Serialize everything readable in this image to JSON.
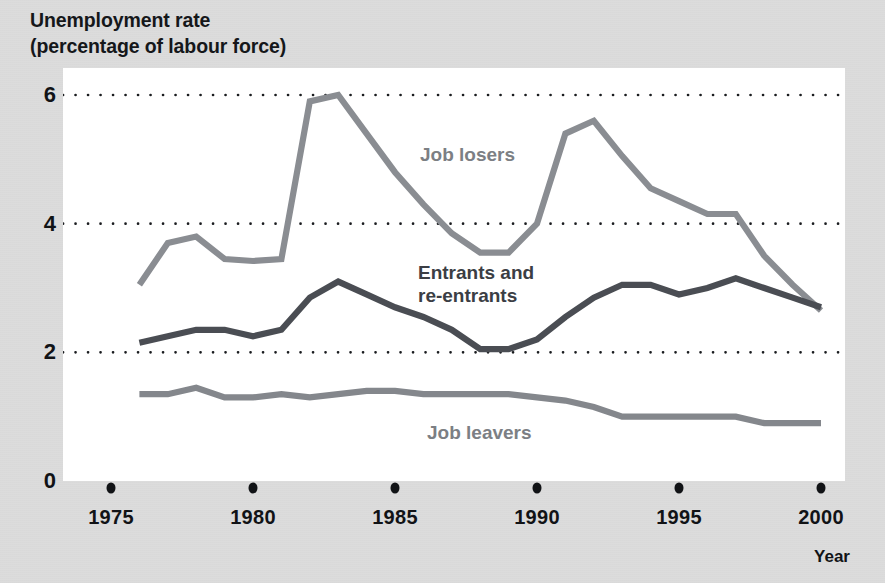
{
  "figure": {
    "title": "Unemployment rate\n(percentage of labour force)",
    "background_color": "#dcdcdc",
    "plot_background_color": "#ffffff"
  },
  "axes": {
    "y": {
      "label": "Unemployment rate (percentage of labour force)",
      "ticks": [
        "0",
        "2",
        "4",
        "6"
      ],
      "tick_values": [
        0,
        2,
        4,
        6
      ],
      "range": [
        0,
        6.4
      ],
      "gridlines_at": [
        2,
        4,
        6
      ],
      "gridline_style": "dotted"
    },
    "x": {
      "label": "Year",
      "ticks": [
        "1975",
        "1980",
        "1985",
        "1990",
        "1995",
        "2000"
      ],
      "tick_values": [
        1975,
        1980,
        1985,
        1990,
        1995,
        2000
      ],
      "range": [
        1974.3,
        2000.9
      ],
      "tick_marker": "dot"
    }
  },
  "series_labels": {
    "job_losers": "Job losers",
    "entrants": "Entrants and\nre-entrants",
    "job_leavers": "Job leavers"
  },
  "colors": {
    "job_losers": "#8a8d92",
    "entrants": "#4a4d53",
    "job_leavers": "#84878c",
    "gridline": "#1a1c1f",
    "text": "#111316",
    "label_light": "#7c7f84",
    "label_dark": "#3b3e44"
  },
  "chart_data": {
    "type": "line",
    "title": "Unemployment rate (percentage of labour force)",
    "xlabel": "Year",
    "ylabel": "Unemployment rate (percentage of labour force)",
    "xlim": [
      1974.3,
      2000.9
    ],
    "ylim": [
      0,
      6.4
    ],
    "grid": true,
    "legend": "inline-labels",
    "x": [
      1976,
      1977,
      1978,
      1979,
      1980,
      1981,
      1982,
      1983,
      1984,
      1985,
      1986,
      1987,
      1988,
      1989,
      1990,
      1991,
      1992,
      1993,
      1994,
      1995,
      1996,
      1997,
      1998,
      1999,
      2000
    ],
    "series": [
      {
        "name": "Job losers",
        "color": "#8a8d92",
        "values": [
          3.05,
          3.7,
          3.8,
          3.45,
          3.42,
          3.45,
          5.9,
          6.0,
          5.4,
          4.8,
          4.3,
          3.85,
          3.55,
          3.55,
          4.0,
          5.4,
          5.6,
          5.05,
          4.55,
          4.35,
          4.15,
          4.15,
          3.5,
          3.05,
          2.65
        ]
      },
      {
        "name": "Entrants and re-entrants",
        "color": "#4a4d53",
        "values": [
          2.15,
          2.25,
          2.35,
          2.35,
          2.25,
          2.35,
          2.85,
          3.1,
          2.9,
          2.7,
          2.55,
          2.35,
          2.05,
          2.05,
          2.2,
          2.55,
          2.85,
          3.05,
          3.05,
          2.9,
          3.0,
          3.15,
          3.0,
          2.85,
          2.7
        ]
      },
      {
        "name": "Job leavers",
        "color": "#84878c",
        "values": [
          1.35,
          1.35,
          1.45,
          1.3,
          1.3,
          1.35,
          1.3,
          1.35,
          1.4,
          1.4,
          1.35,
          1.35,
          1.35,
          1.35,
          1.3,
          1.25,
          1.15,
          1.0,
          1.0,
          1.0,
          1.0,
          1.0,
          0.9,
          0.9,
          0.9
        ]
      }
    ]
  }
}
